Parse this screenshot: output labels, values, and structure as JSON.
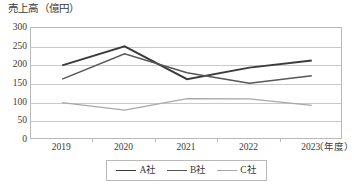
{
  "chart_data": {
    "type": "line",
    "title": "売上高（億円）",
    "xlabel": "（年度）",
    "ylabel": "",
    "categories": [
      "2019",
      "2020",
      "2021",
      "2022",
      "2023"
    ],
    "ylim": [
      0,
      300
    ],
    "ytick_values": [
      300,
      250,
      200,
      150,
      100,
      50,
      0
    ],
    "ytick_labels": [
      "300",
      "250",
      "200",
      "150",
      "100",
      "50",
      "0"
    ],
    "grid": true,
    "legend_position": "bottom",
    "series": [
      {
        "name": "A社",
        "color": "#3b3b3b",
        "width": 1.9,
        "values": [
          200,
          251,
          163,
          194,
          213
        ]
      },
      {
        "name": "B社",
        "color": "#565656",
        "width": 1.5,
        "values": [
          163,
          231,
          180,
          152,
          172
        ]
      },
      {
        "name": "C社",
        "color": "#a8a8a8",
        "width": 1.3,
        "values": [
          100,
          80,
          111,
          110,
          93
        ]
      }
    ]
  },
  "axes": {
    "frame_color": "#b9b9b9",
    "gridline_color": "#c9c9c9"
  }
}
